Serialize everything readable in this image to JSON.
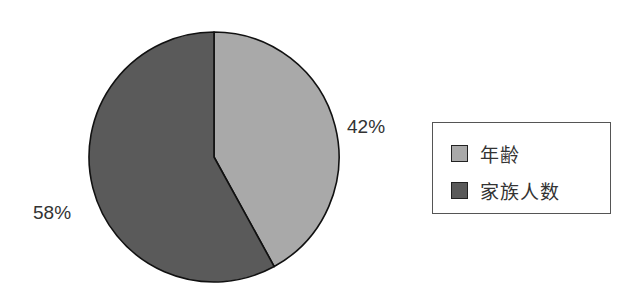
{
  "chart_data": {
    "type": "pie",
    "title": "",
    "categories": [
      "年齢",
      "家族人数"
    ],
    "values": [
      42,
      58
    ],
    "labels": [
      "42%",
      "58%"
    ],
    "colors": [
      "#a9a9a9",
      "#5a5a5a"
    ],
    "start_angle_deg": 0,
    "direction": "clockwise",
    "legend_position": "right"
  },
  "labels": {
    "slice_0_pct": "42%",
    "slice_1_pct": "58%"
  },
  "legend": {
    "items": [
      {
        "label": "年齢",
        "color": "#a9a9a9"
      },
      {
        "label": "家族人数",
        "color": "#5a5a5a"
      }
    ]
  }
}
